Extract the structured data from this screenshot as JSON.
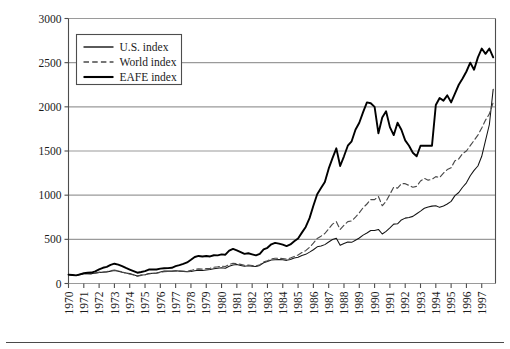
{
  "chart_data": {
    "type": "line",
    "title": "",
    "xlabel": "",
    "ylabel": "",
    "grid": true,
    "legend_position": "top-left",
    "ylim": [
      0,
      3000
    ],
    "ytick_labels": [
      "0",
      "500",
      "1000",
      "1500",
      "2000",
      "2500",
      "3000"
    ],
    "ytick_values": [
      0,
      500,
      1000,
      1500,
      2000,
      2500,
      3000
    ],
    "xlim": [
      1970,
      1997.9
    ],
    "xtick_labels": [
      "1970",
      "1971",
      "1972",
      "1973",
      "1974",
      "1975",
      "1976",
      "1977",
      "1978",
      "1979",
      "1980",
      "1981",
      "1982",
      "1983",
      "1984",
      "1985",
      "1986",
      "1987",
      "1988",
      "1989",
      "1990",
      "1991",
      "1992",
      "1993",
      "1994",
      "1995",
      "1996",
      "1997"
    ],
    "xtick_values": [
      1970,
      1971,
      1972,
      1973,
      1974,
      1975,
      1976,
      1977,
      1978,
      1979,
      1980,
      1981,
      1982,
      1983,
      1984,
      1985,
      1986,
      1987,
      1988,
      1989,
      1990,
      1991,
      1992,
      1993,
      1994,
      1995,
      1996,
      1997
    ],
    "series": [
      {
        "name": "U.S. index",
        "style": "solid-thin",
        "color": "#141414",
        "x": [
          1970.0,
          1970.25,
          1970.5,
          1970.75,
          1971.0,
          1971.25,
          1971.5,
          1971.75,
          1972.0,
          1972.25,
          1972.5,
          1972.75,
          1973.0,
          1973.25,
          1973.5,
          1973.75,
          1974.0,
          1974.25,
          1974.5,
          1974.75,
          1975.0,
          1975.25,
          1975.5,
          1975.75,
          1976.0,
          1976.25,
          1976.5,
          1976.75,
          1977.0,
          1977.25,
          1977.5,
          1977.75,
          1978.0,
          1978.25,
          1978.5,
          1978.75,
          1979.0,
          1979.25,
          1979.5,
          1979.75,
          1980.0,
          1980.25,
          1980.5,
          1980.75,
          1981.0,
          1981.25,
          1981.5,
          1981.75,
          1982.0,
          1982.25,
          1982.5,
          1982.75,
          1983.0,
          1983.25,
          1983.5,
          1983.75,
          1984.0,
          1984.25,
          1984.5,
          1984.75,
          1985.0,
          1985.25,
          1985.5,
          1985.75,
          1986.0,
          1986.25,
          1986.5,
          1986.75,
          1987.0,
          1987.25,
          1987.5,
          1987.75,
          1988.0,
          1988.25,
          1988.5,
          1988.75,
          1989.0,
          1989.25,
          1989.5,
          1989.75,
          1990.0,
          1990.25,
          1990.5,
          1990.75,
          1991.0,
          1991.25,
          1991.5,
          1991.75,
          1992.0,
          1992.25,
          1992.5,
          1992.75,
          1993.0,
          1993.25,
          1993.5,
          1993.75,
          1994.0,
          1994.25,
          1994.5,
          1994.75,
          1995.0,
          1995.25,
          1995.5,
          1995.75,
          1996.0,
          1996.25,
          1996.5,
          1996.75,
          1997.0,
          1997.25,
          1997.5,
          1997.75
        ],
        "values": [
          100,
          96,
          90,
          104,
          112,
          114,
          110,
          118,
          126,
          128,
          130,
          140,
          148,
          140,
          128,
          120,
          112,
          100,
          86,
          96,
          100,
          112,
          116,
          118,
          130,
          140,
          142,
          140,
          144,
          140,
          136,
          132,
          136,
          144,
          150,
          146,
          152,
          158,
          168,
          172,
          178,
          172,
          196,
          210,
          214,
          205,
          195,
          200,
          196,
          192,
          205,
          235,
          248,
          266,
          270,
          272,
          270,
          262,
          272,
          288,
          298,
          318,
          330,
          355,
          382,
          415,
          424,
          440,
          470,
          498,
          512,
          432,
          452,
          470,
          466,
          490,
          515,
          548,
          572,
          600,
          600,
          612,
          560,
          590,
          630,
          672,
          676,
          720,
          740,
          748,
          760,
          790,
          820,
          852,
          866,
          876,
          880,
          862,
          878,
          900,
          930,
          995,
          1030,
          1090,
          1140,
          1220,
          1280,
          1330,
          1440,
          1620,
          1800,
          2200
        ]
      },
      {
        "name": "World index",
        "style": "dashed",
        "color": "#4a4a4a",
        "x": [
          1970.0,
          1970.25,
          1970.5,
          1970.75,
          1971.0,
          1971.25,
          1971.5,
          1971.75,
          1972.0,
          1972.25,
          1972.5,
          1972.75,
          1973.0,
          1973.25,
          1973.5,
          1973.75,
          1974.0,
          1974.25,
          1974.5,
          1974.75,
          1975.0,
          1975.25,
          1975.5,
          1975.75,
          1976.0,
          1976.25,
          1976.5,
          1976.75,
          1977.0,
          1977.25,
          1977.5,
          1977.75,
          1978.0,
          1978.25,
          1978.5,
          1978.75,
          1979.0,
          1979.25,
          1979.5,
          1979.75,
          1980.0,
          1980.25,
          1980.5,
          1980.75,
          1981.0,
          1981.25,
          1981.5,
          1981.75,
          1982.0,
          1982.25,
          1982.5,
          1982.75,
          1983.0,
          1983.25,
          1983.5,
          1983.75,
          1984.0,
          1984.25,
          1984.5,
          1984.75,
          1985.0,
          1985.25,
          1985.5,
          1985.75,
          1986.0,
          1986.25,
          1986.5,
          1986.75,
          1987.0,
          1987.25,
          1987.5,
          1987.75,
          1988.0,
          1988.25,
          1988.5,
          1988.75,
          1989.0,
          1989.25,
          1989.5,
          1989.75,
          1990.0,
          1990.25,
          1990.5,
          1990.75,
          1991.0,
          1991.25,
          1991.5,
          1991.75,
          1992.0,
          1992.25,
          1992.5,
          1992.75,
          1993.0,
          1993.25,
          1993.5,
          1993.75,
          1994.0,
          1994.25,
          1994.5,
          1994.75,
          1995.0,
          1995.25,
          1995.5,
          1995.75,
          1996.0,
          1996.25,
          1996.5,
          1996.75,
          1997.0,
          1997.25,
          1997.5,
          1997.75
        ],
        "values": [
          100,
          95,
          88,
          100,
          110,
          112,
          108,
          116,
          126,
          130,
          134,
          146,
          152,
          144,
          130,
          118,
          108,
          96,
          84,
          92,
          98,
          110,
          114,
          116,
          126,
          134,
          136,
          136,
          142,
          140,
          140,
          138,
          148,
          160,
          166,
          162,
          168,
          172,
          184,
          188,
          196,
          192,
          216,
          228,
          226,
          216,
          206,
          210,
          204,
          198,
          212,
          244,
          258,
          278,
          286,
          286,
          282,
          276,
          288,
          306,
          322,
          350,
          372,
          410,
          456,
          510,
          536,
          566,
          620,
          672,
          700,
          612,
          660,
          700,
          708,
          752,
          800,
          858,
          900,
          950,
          950,
          985,
          880,
          930,
          1010,
          1090,
          1080,
          1130,
          1130,
          1110,
          1090,
          1100,
          1160,
          1190,
          1170,
          1180,
          1210,
          1200,
          1250,
          1290,
          1310,
          1390,
          1410,
          1470,
          1500,
          1560,
          1620,
          1680,
          1760,
          1850,
          1920,
          2050
        ]
      },
      {
        "name": "EAFE index",
        "style": "solid-thick",
        "color": "#000000",
        "x": [
          1970.0,
          1970.25,
          1970.5,
          1970.75,
          1971.0,
          1971.25,
          1971.5,
          1971.75,
          1972.0,
          1972.25,
          1972.5,
          1972.75,
          1973.0,
          1973.25,
          1973.5,
          1973.75,
          1974.0,
          1974.25,
          1974.5,
          1974.75,
          1975.0,
          1975.25,
          1975.5,
          1975.75,
          1976.0,
          1976.25,
          1976.5,
          1976.75,
          1977.0,
          1977.25,
          1977.5,
          1977.75,
          1978.0,
          1978.25,
          1978.5,
          1978.75,
          1979.0,
          1979.25,
          1979.5,
          1979.75,
          1980.0,
          1980.25,
          1980.5,
          1980.75,
          1981.0,
          1981.25,
          1981.5,
          1981.75,
          1982.0,
          1982.25,
          1982.5,
          1982.75,
          1983.0,
          1983.25,
          1983.5,
          1983.75,
          1984.0,
          1984.25,
          1984.5,
          1984.75,
          1985.0,
          1985.25,
          1985.5,
          1985.75,
          1986.0,
          1986.25,
          1986.5,
          1986.75,
          1987.0,
          1987.25,
          1987.5,
          1987.75,
          1988.0,
          1988.25,
          1988.5,
          1988.75,
          1989.0,
          1989.25,
          1989.5,
          1989.75,
          1990.0,
          1990.25,
          1990.5,
          1990.75,
          1991.0,
          1991.25,
          1991.5,
          1991.75,
          1992.0,
          1992.25,
          1992.5,
          1992.75,
          1993.0,
          1993.25,
          1993.5,
          1993.75,
          1994.0,
          1994.25,
          1994.5,
          1994.75,
          1995.0,
          1995.25,
          1995.5,
          1995.75,
          1996.0,
          1996.25,
          1996.5,
          1996.75,
          1997.0,
          1997.25,
          1997.5,
          1997.75
        ],
        "values": [
          100,
          96,
          92,
          104,
          116,
          122,
          124,
          138,
          160,
          178,
          188,
          210,
          224,
          214,
          196,
          176,
          158,
          140,
          122,
          130,
          140,
          158,
          160,
          158,
          168,
          172,
          174,
          178,
          196,
          208,
          222,
          238,
          268,
          300,
          312,
          306,
          312,
          306,
          320,
          318,
          330,
          326,
          372,
          392,
          376,
          356,
          336,
          342,
          330,
          318,
          336,
          386,
          404,
          444,
          460,
          452,
          440,
          424,
          442,
          478,
          510,
          576,
          640,
          740,
          880,
          1010,
          1080,
          1150,
          1300,
          1420,
          1530,
          1330,
          1440,
          1560,
          1610,
          1740,
          1820,
          1940,
          2050,
          2040,
          2000,
          1700,
          1880,
          1950,
          1770,
          1680,
          1820,
          1740,
          1620,
          1560,
          1480,
          1440,
          1560,
          1560,
          1560,
          1560,
          2020,
          2100,
          2070,
          2130,
          2050,
          2150,
          2250,
          2320,
          2400,
          2500,
          2420,
          2560,
          2660,
          2600,
          2660,
          2560
        ]
      }
    ]
  },
  "legend": {
    "entries": [
      {
        "label": "U.S. index",
        "style": "solid-thin"
      },
      {
        "label": "World index",
        "style": "dashed"
      },
      {
        "label": "EAFE index",
        "style": "solid-thick"
      }
    ]
  },
  "colors": {
    "axis": "#4d4d4d",
    "grid": "#9a9a9a",
    "frame": "#8a8a8a",
    "text": "#1a1a1a",
    "background": "#ffffff",
    "rule": "#4a4a4a"
  }
}
